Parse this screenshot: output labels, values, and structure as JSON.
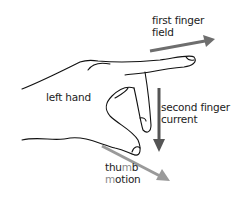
{
  "diagram": {
    "hand_label": "left hand",
    "first_finger": {
      "line1": "first finger",
      "line2": "field",
      "arrow_color": "#6e6e6e"
    },
    "second_finger": {
      "line1": "second finger",
      "line2": "current",
      "arrow_color": "#555555"
    },
    "thumb": {
      "line1_a": "thu",
      "line1_b": "m",
      "line1_c": "b",
      "line2_a": "m",
      "line2_b": "otion",
      "arrow_color": "#9a9a9a"
    }
  }
}
